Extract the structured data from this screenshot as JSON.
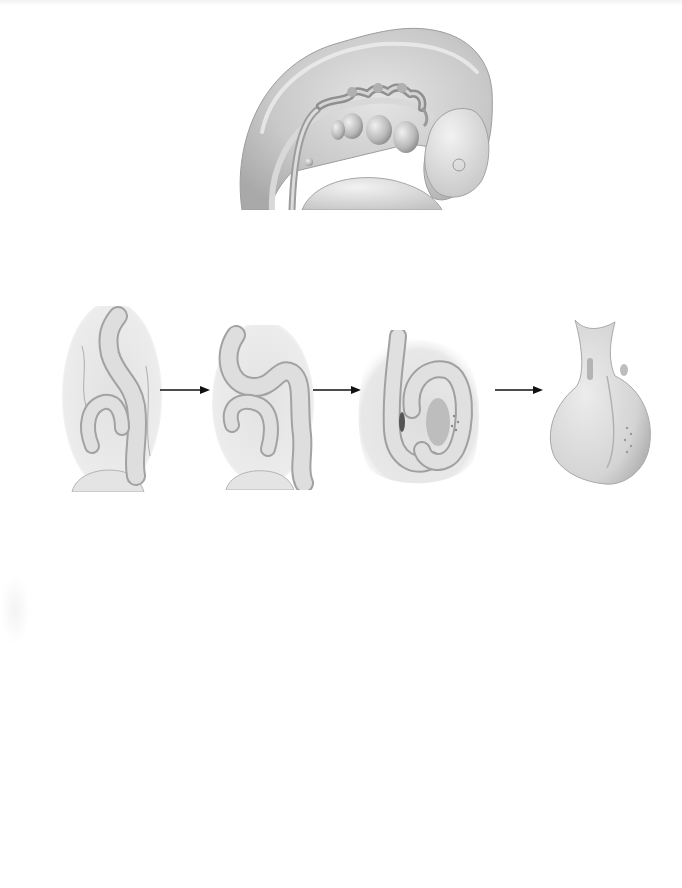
{
  "page": {
    "background": "#ffffff",
    "type": "textbook-illustration-page"
  },
  "figures": {
    "top": {
      "name": "embryo-head-lateral-view",
      "description": "Embryo head region with developing pharyngeal arches and early heart tube",
      "tone": "#c8c8c8"
    },
    "sequence": [
      {
        "stage": 1,
        "name": "straight-to-bending-heart-tube"
      },
      {
        "stage": 2,
        "name": "s-shaped-looping-heart-tube"
      },
      {
        "stage": 3,
        "name": "looped-heart-tube-with-chambers"
      },
      {
        "stage": 4,
        "name": "primitive-heart-external-view"
      }
    ],
    "arrows": [
      {
        "from": 1,
        "to": 2,
        "glyph": "→"
      },
      {
        "from": 2,
        "to": 3,
        "glyph": "→"
      },
      {
        "from": 3,
        "to": 4,
        "glyph": "→"
      }
    ]
  },
  "colors": {
    "tissue_light": "#e6e6e6",
    "tissue_mid": "#cfcfcf",
    "tissue_dark": "#9a9a9a",
    "outline": "#8a8a8a",
    "arrow": "#111111"
  }
}
